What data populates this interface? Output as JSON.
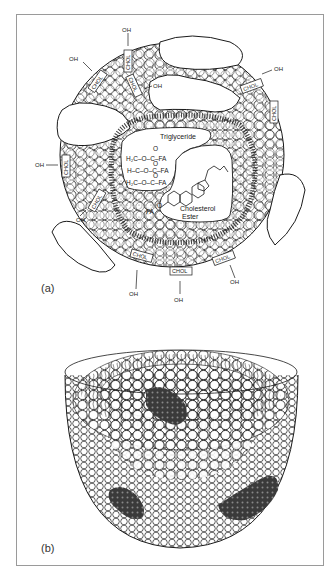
{
  "figure": {
    "panels": [
      {
        "id": "a",
        "label": "(a)",
        "title_regions": {
          "triglyceride_label": "Triglyceride",
          "cholesterol_ester_label_line1": "Cholesterol",
          "cholesterol_ester_label_line2": "Ester"
        },
        "triglyceride_formula": {
          "row1": "H₂C–O–C–FA",
          "row2": "H–C–O–C–FA",
          "row3": "H₂C–O–C–FA",
          "carbonyl": "O"
        },
        "ester_link": {
          "fa": "FA",
          "o": "O"
        },
        "surface_labels": {
          "chol": "CHOL",
          "oh": "OH"
        },
        "chol_count": 9,
        "oh_count": 9
      },
      {
        "id": "b",
        "label": "(b)",
        "description": "Hemisphere cutaway of lipoprotein with phospholipid monolayer and embedded apolipoproteins"
      }
    ],
    "colors": {
      "line": "#1a1a1a",
      "frame": "#9a9a9a",
      "protein": "#3a3a3a",
      "background": "#ffffff"
    }
  }
}
